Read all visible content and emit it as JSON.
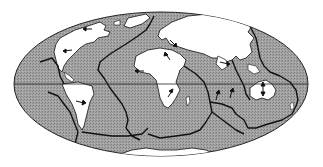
{
  "map": {
    "type": "world-tectonic-plates",
    "projection": "elliptical-equal-area",
    "colors": {
      "background": "#ffffff",
      "ocean": "#9a9a9a",
      "land": "#ffffff",
      "boundary": "#111111",
      "equator": "#222222"
    },
    "features": {
      "equator_line": true,
      "plate_boundaries": true,
      "motion_arrows": true
    },
    "landmasses": [
      "North America",
      "South America",
      "Europe-Asia",
      "Africa",
      "India",
      "Australia",
      "Antarctica",
      "Greenland"
    ],
    "arrows": [
      {
        "name": "north-america-arrow-1",
        "x": 90,
        "y": 29
      },
      {
        "name": "north-america-arrow-2",
        "x": 66,
        "y": 50
      },
      {
        "name": "caribbean-arrow",
        "x": 138,
        "y": 71
      },
      {
        "name": "south-america-arrow",
        "x": 82,
        "y": 101
      },
      {
        "name": "europe-arrow",
        "x": 165,
        "y": 58
      },
      {
        "name": "africa-arrow-west",
        "x": 140,
        "y": 70
      },
      {
        "name": "africa-arrow-north",
        "x": 168,
        "y": 58
      },
      {
        "name": "africa-arrow-south",
        "x": 168,
        "y": 95
      },
      {
        "name": "asia-arrow",
        "x": 225,
        "y": 64
      },
      {
        "name": "india-arrow",
        "x": 218,
        "y": 98
      },
      {
        "name": "pacific-arrow",
        "x": 231,
        "y": 94
      },
      {
        "name": "australia-arrow",
        "x": 263,
        "y": 88
      }
    ]
  }
}
